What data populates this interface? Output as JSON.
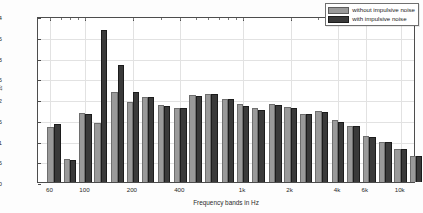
{
  "chart_data": {
    "type": "bar",
    "title": "",
    "xlabel": "Frequency bands in Hz",
    "ylabel": "T20 in s",
    "ylabel_base": "T",
    "ylabel_sub": "20",
    "ylabel_unit": " in s",
    "ylim": [
      0,
      4
    ],
    "yticks": [
      0,
      0.5,
      1,
      1.5,
      2,
      2.5,
      3,
      3.5,
      4
    ],
    "ytick_labels": [
      "0",
      "0.5",
      "1",
      "1.5",
      "2",
      "2.5",
      "3",
      "3.5",
      "4"
    ],
    "xscale": "log",
    "xlim": [
      50,
      12500
    ],
    "xtick_values": [
      60,
      100,
      200,
      400,
      1000,
      2000,
      4000,
      6000,
      10000
    ],
    "xtick_labels": [
      "60",
      "100",
      "200",
      "400",
      "1k",
      "2k",
      "4k",
      "6k",
      "10k"
    ],
    "grid": true,
    "legend_position": "top-right",
    "categories": [
      "63",
      "80",
      "100",
      "125",
      "160",
      "200",
      "250",
      "315",
      "400",
      "500",
      "630",
      "800",
      "1000",
      "1250",
      "1600",
      "2000",
      "2500",
      "3150",
      "4000",
      "5000",
      "6300",
      "8000",
      "10000",
      "12500"
    ],
    "series": [
      {
        "name": "without impulsive noise",
        "color": "#9a9a9a",
        "values": [
          1.32,
          0.56,
          1.67,
          1.43,
          2.18,
          1.93,
          2.05,
          1.86,
          1.79,
          2.09,
          2.13,
          2.01,
          1.87,
          1.79,
          1.89,
          1.8,
          1.65,
          1.71,
          1.49,
          1.36,
          1.1,
          0.97,
          0.79,
          0.63
        ]
      },
      {
        "name": "with impulsive noise",
        "color": "#3a3a3a",
        "values": [
          1.41,
          0.54,
          1.63,
          3.66,
          2.82,
          2.17,
          2.04,
          1.84,
          1.79,
          2.08,
          2.13,
          2.0,
          1.83,
          1.73,
          1.86,
          1.79,
          1.63,
          1.69,
          1.44,
          1.36,
          1.09,
          0.97,
          0.79,
          0.63
        ]
      }
    ]
  },
  "legend": {
    "entries": [
      {
        "label": "without impulsive noise",
        "swatch": "gray-swatch"
      },
      {
        "label": "with impulsive noise",
        "swatch": "dark-swatch"
      }
    ]
  }
}
